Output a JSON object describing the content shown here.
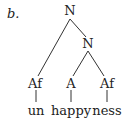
{
  "example_label": "b.",
  "tree": {
    "root": {
      "label": "N"
    },
    "inner": {
      "label": "N"
    },
    "leaves": [
      {
        "category": "Af",
        "morpheme": "un"
      },
      {
        "category": "A",
        "morpheme": "happy"
      },
      {
        "category": "Af",
        "morpheme": "ness"
      }
    ]
  }
}
